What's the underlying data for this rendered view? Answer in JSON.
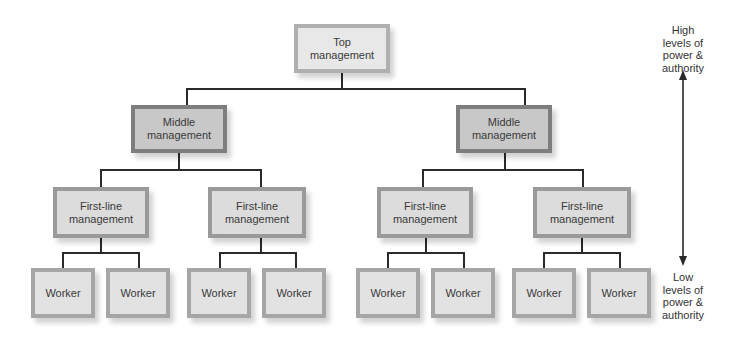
{
  "diagram": {
    "type": "org-chart",
    "levels": {
      "top": {
        "label": "Top management"
      },
      "middle": [
        {
          "label": "Middle management"
        },
        {
          "label": "Middle management"
        }
      ],
      "first_line": [
        {
          "label": "First-line management"
        },
        {
          "label": "First-line management"
        },
        {
          "label": "First-line management"
        },
        {
          "label": "First-line management"
        }
      ],
      "workers": [
        {
          "label": "Worker"
        },
        {
          "label": "Worker"
        },
        {
          "label": "Worker"
        },
        {
          "label": "Worker"
        },
        {
          "label": "Worker"
        },
        {
          "label": "Worker"
        },
        {
          "label": "Worker"
        },
        {
          "label": "Worker"
        }
      ]
    },
    "scale": {
      "high_label": "High levels of power & authority",
      "high_lines": [
        "High",
        "levels of",
        "power &",
        "authority"
      ],
      "low_label": "Low levels of power & authority",
      "low_lines": [
        "Low",
        "levels of",
        "power &",
        "authority"
      ]
    },
    "colors": {
      "top_fill": "#e8e8e8",
      "middle_fill": "#c8c8c8",
      "first_line_fill": "#dcdcdc",
      "worker_fill": "#e2e2e2",
      "connector": "#2a2a2a"
    }
  }
}
